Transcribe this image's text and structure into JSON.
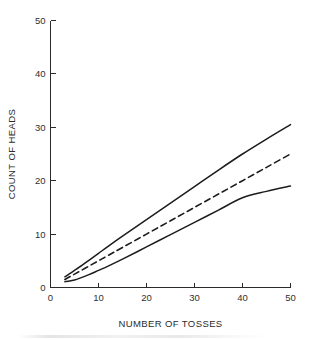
{
  "chart_data": {
    "type": "line",
    "title": "",
    "xlabel": "NUMBER OF TOSSES",
    "ylabel": "COUNT OF HEADS",
    "xlim": [
      0,
      50
    ],
    "ylim": [
      0,
      50
    ],
    "xticks": [
      0,
      10,
      20,
      30,
      40,
      50
    ],
    "yticks": [
      0,
      10,
      20,
      30,
      40,
      50
    ],
    "xtick_labels": [
      "0",
      "10",
      "20",
      "30",
      "40",
      "50"
    ],
    "ytick_labels": [
      "0",
      "10",
      "20",
      "30",
      "40",
      "50"
    ],
    "grid": false,
    "legend": "none",
    "frame": "left-bottom-only",
    "tick_direction": "in",
    "series": [
      {
        "name": "upper-bound",
        "style": "solid",
        "color": "#1c1c1c",
        "x": [
          3,
          4,
          5,
          6,
          8,
          10,
          12,
          15,
          20,
          25,
          30,
          35,
          40,
          45,
          50
        ],
        "y": [
          2.0,
          2.6,
          3.2,
          3.8,
          5.1,
          6.4,
          7.7,
          9.6,
          12.7,
          15.8,
          18.9,
          22.0,
          25.0,
          27.8,
          30.5
        ]
      },
      {
        "name": "expected-value",
        "style": "dashed",
        "color": "#1c1c1c",
        "x": [
          3,
          4,
          5,
          6,
          8,
          10,
          12,
          15,
          20,
          25,
          30,
          35,
          40,
          45,
          50
        ],
        "y": [
          1.5,
          2.0,
          2.5,
          3.0,
          4.0,
          5.0,
          6.0,
          7.5,
          10.0,
          12.5,
          15.0,
          17.5,
          20.0,
          22.5,
          25.0
        ]
      },
      {
        "name": "lower-bound",
        "style": "solid",
        "color": "#1c1c1c",
        "x": [
          3,
          4,
          5,
          6,
          8,
          10,
          12,
          15,
          20,
          25,
          30,
          35,
          40,
          45,
          50
        ],
        "y": [
          1.1,
          1.2,
          1.4,
          1.7,
          2.4,
          3.2,
          4.0,
          5.3,
          7.6,
          9.9,
          12.2,
          14.5,
          16.8,
          18.0,
          19.0
        ]
      }
    ]
  }
}
